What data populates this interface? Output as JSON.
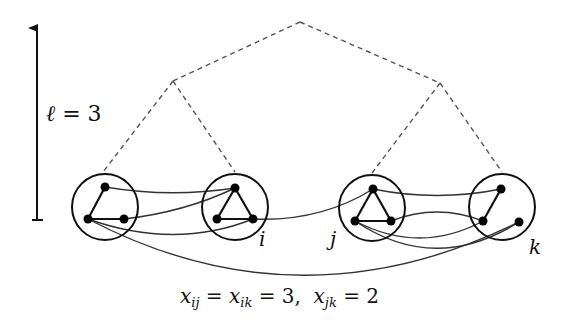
{
  "axis": {
    "label_var": "ℓ",
    "label_eq": " = 3",
    "arrow": "up"
  },
  "tree": {
    "root": [
      300,
      22
    ],
    "internal": [
      [
        173,
        81
      ],
      [
        440,
        83
      ]
    ],
    "leaves_attach": [
      [
        103,
        172
      ],
      [
        235,
        172
      ],
      [
        372,
        173
      ],
      [
        502,
        172
      ]
    ],
    "style": "dashed"
  },
  "clusters": [
    {
      "id": "c1",
      "label": "",
      "center": [
        105,
        207
      ],
      "nodes": [
        [
          105,
          187
        ],
        [
          88,
          219
        ],
        [
          124,
          219
        ]
      ],
      "edges": [
        [
          0,
          1
        ],
        [
          1,
          2
        ]
      ]
    },
    {
      "id": "i",
      "label": "i",
      "center": [
        235,
        207
      ],
      "nodes": [
        [
          235,
          188
        ],
        [
          217,
          219
        ],
        [
          253,
          219
        ]
      ],
      "edges": [
        [
          0,
          1
        ],
        [
          1,
          2
        ],
        [
          0,
          2
        ]
      ]
    },
    {
      "id": "j",
      "label": "j",
      "center": [
        372,
        208
      ],
      "nodes": [
        [
          373,
          189
        ],
        [
          355,
          221
        ],
        [
          391,
          221
        ]
      ],
      "edges": [
        [
          0,
          1
        ],
        [
          1,
          2
        ],
        [
          0,
          2
        ]
      ]
    },
    {
      "id": "k",
      "label": "k",
      "center": [
        502,
        207
      ],
      "nodes": [
        [
          501,
          189
        ],
        [
          483,
          221
        ],
        [
          519,
          222
        ]
      ],
      "edges": [
        [
          0,
          1
        ]
      ]
    }
  ],
  "cluster_labels": {
    "i": "i",
    "j": "j",
    "k": "k"
  },
  "caption": {
    "x_ij": "x",
    "sub_ij": "ij",
    "eq1": " = ",
    "x_ik": "x",
    "sub_ik": "ik",
    "eq2": " = 3,  ",
    "x_jk": "x",
    "sub_jk": "jk",
    "eq3": " = 2"
  }
}
